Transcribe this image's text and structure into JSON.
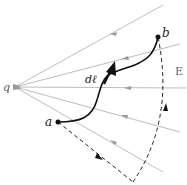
{
  "diagram": {
    "type": "electric-field-path-integral",
    "charge": {
      "label": "q",
      "x": 15,
      "y": 87
    },
    "field_label": "E",
    "field_lines": [
      {
        "x2": 163,
        "y2": 5,
        "arrow_at": 0.65
      },
      {
        "x2": 180,
        "y2": 44,
        "arrow_at": 0.65
      },
      {
        "x2": 185,
        "y2": 88,
        "arrow_at": 0.65
      },
      {
        "x2": 180,
        "y2": 132,
        "arrow_at": 0.65
      },
      {
        "x2": 163,
        "y2": 172,
        "arrow_at": 0.65
      }
    ],
    "field_arrow_direction": "toward-charge",
    "points": {
      "a": {
        "label": "a",
        "x": 58,
        "y": 122
      },
      "b": {
        "label": "b",
        "x": 158,
        "y": 37
      }
    },
    "solid_path_label": "dℓ",
    "dashed_path": "radial then arc",
    "colors": {
      "field_line": "#b8b8b8",
      "path": "#111111",
      "text": "#222222",
      "field_label": "#666666"
    }
  }
}
